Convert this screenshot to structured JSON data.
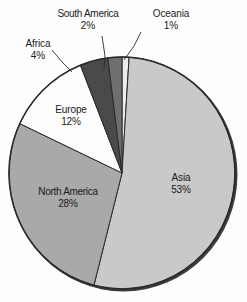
{
  "chart_data": {
    "type": "pie",
    "title": "",
    "subtitle": "",
    "xlabel": "",
    "ylabel": "",
    "legend_position": "none",
    "grid": false,
    "value_unit": "%",
    "start_angle_deg": 0,
    "direction": "clockwise",
    "categories": [
      "Oceania",
      "Asia",
      "North America",
      "Europe",
      "Africa",
      "South America"
    ],
    "values": [
      1,
      53,
      28,
      12,
      4,
      2
    ],
    "slices": [
      {
        "label": "Oceania",
        "value": 1,
        "value_text": "1%",
        "color": "#ededed",
        "label_placement": "outside"
      },
      {
        "label": "Asia",
        "value": 53,
        "value_text": "53%",
        "color": "#c9c9c9",
        "label_placement": "inside"
      },
      {
        "label": "North America",
        "value": 28,
        "value_text": "28%",
        "color": "#a9a9a9",
        "label_placement": "inside"
      },
      {
        "label": "Europe",
        "value": 12,
        "value_text": "12%",
        "color": "#fdfdfd",
        "label_placement": "inside"
      },
      {
        "label": "Africa",
        "value": 4,
        "value_text": "4%",
        "color": "#4a4a4a",
        "label_placement": "outside"
      },
      {
        "label": "South America",
        "value": 2,
        "value_text": "2%",
        "color": "#6f6f6f",
        "label_placement": "outside"
      }
    ]
  },
  "labels": {
    "south_america": {
      "name": "South America",
      "percent": "2%"
    },
    "oceania": {
      "name": "Oceania",
      "percent": "1%"
    },
    "africa": {
      "name": "Africa",
      "percent": "4%"
    },
    "europe": {
      "name": "Europe",
      "percent": "12%"
    },
    "north_america": {
      "name": "North America",
      "percent": "28%"
    },
    "asia": {
      "name": "Asia",
      "percent": "53%"
    }
  },
  "colors": {
    "outline": "#2b2b2b",
    "text": "#1a1a1a",
    "background": "#fefefe",
    "shadow": "#3a3a3a"
  }
}
